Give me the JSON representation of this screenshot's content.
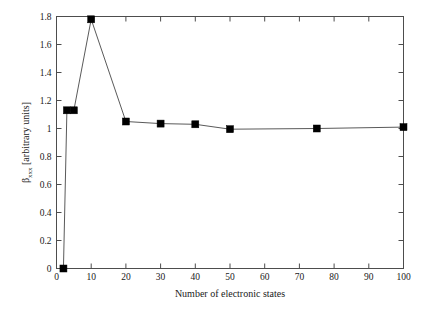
{
  "chart_data": {
    "type": "line",
    "title": "",
    "xlabel": "Number of electronic states",
    "ylabel": "βxxx [arbitrary units]",
    "ylabel_base": "β",
    "ylabel_sub": "xxx",
    "ylabel_rest": " [arbitrary units]",
    "xlim": [
      0,
      100
    ],
    "ylim": [
      0,
      1.8
    ],
    "grid": false,
    "legend": false,
    "marker": "square",
    "line_color": "#5a5a5a",
    "marker_color": "#000000",
    "x": [
      2,
      3,
      5,
      10,
      20,
      30,
      40,
      50,
      75,
      100
    ],
    "values": [
      0.0,
      1.13,
      1.13,
      1.78,
      1.05,
      1.035,
      1.03,
      0.995,
      1.0,
      1.01
    ],
    "xticks": [
      0,
      10,
      20,
      30,
      40,
      50,
      60,
      70,
      80,
      90,
      100
    ],
    "xticklabels": [
      "0",
      "10",
      "20",
      "30",
      "40",
      "50",
      "60",
      "70",
      "80",
      "90",
      "100"
    ],
    "yticks": [
      0,
      0.2,
      0.4,
      0.6,
      0.8,
      1.0,
      1.2,
      1.4,
      1.6,
      1.8
    ],
    "yticklabels": [
      "0",
      "0.2",
      "0.4",
      "0.6",
      "0.8",
      "1",
      "1.2",
      "1.4",
      "1.6",
      "1.8"
    ]
  }
}
